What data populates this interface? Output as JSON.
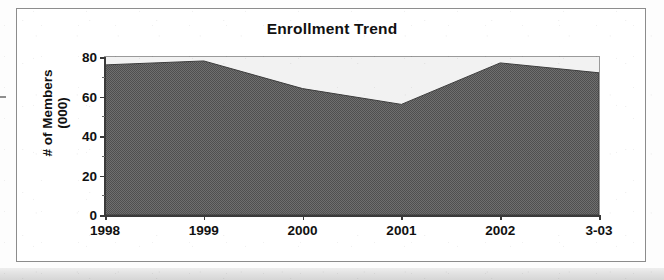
{
  "chart_data": {
    "type": "area",
    "title": "Enrollment Trend",
    "xlabel": "",
    "ylabel": "# of Members (000)",
    "ylabel_lines": [
      "# of Members",
      "(000)"
    ],
    "categories": [
      "1998",
      "1999",
      "2000",
      "2001",
      "2002",
      "3-03"
    ],
    "values": [
      76,
      78,
      64,
      56,
      77,
      72
    ],
    "series": [
      {
        "name": "# of Members (000)",
        "values": [
          76,
          78,
          64,
          56,
          77,
          72
        ]
      }
    ],
    "ylim": [
      0,
      80
    ],
    "yticks": [
      0,
      20,
      40,
      60,
      80
    ],
    "ytick_labels": [
      "0",
      "20",
      "40",
      "60",
      "80"
    ],
    "y_minor_ticks": [
      10,
      30,
      50,
      70
    ],
    "grid": false,
    "legend": "none",
    "colors": {
      "area_fill": "#6b6b6b",
      "plot_background": "#f2f2f2",
      "axis": "#3a3a3a",
      "frame": "#8c8c8c",
      "text": "#111111"
    }
  }
}
